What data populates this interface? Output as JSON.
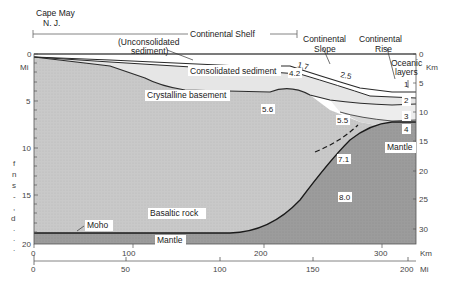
{
  "header": {
    "location_line1": "Cape May",
    "location_line2": "N. J.",
    "shelf_label": "Continental Shelf",
    "slope_line1": "Continental",
    "slope_line2": "Slope",
    "rise_line1": "Continental",
    "rise_line2": "Rise"
  },
  "layers": {
    "unconsolidated_line1": "(Unconsolidated",
    "unconsolidated_line2": "sediment)",
    "consolidated": "Consolidated sediment",
    "crystalline": "Crystalline basement",
    "basaltic": "Basaltic rock",
    "moho": "Moho",
    "mantle_left": "Mantle",
    "mantle_right": "Mantle",
    "oceanic_line1": "Oceanic",
    "oceanic_line2": "layers",
    "oceanic_1": "1",
    "oceanic_2": "2",
    "oceanic_3": "3",
    "oceanic_4": "4"
  },
  "velocities": {
    "v17": "1.7",
    "v25": "2.5",
    "v42": "4.2",
    "v56": "5.6",
    "v55": "5.5",
    "v71": "7.1",
    "v80": "8.0"
  },
  "axes": {
    "left_unit": "Mi",
    "left_ticks": [
      "0",
      "5",
      "10",
      "15",
      "20"
    ],
    "right_unit": "Km",
    "right_ticks": [
      "0",
      "5",
      "10",
      "15",
      "20",
      "25",
      "30"
    ],
    "bottom_km_unit": "Km",
    "bottom_km_ticks": [
      "0",
      "100",
      "200",
      "300"
    ],
    "bottom_mi_unit": "Mi",
    "bottom_mi_ticks": [
      "0",
      "50",
      "100",
      "150",
      "200"
    ]
  },
  "side_text_fragments": [
    "f",
    "n",
    "s",
    "-",
    ",",
    "d",
    ".",
    ".",
    "."
  ],
  "colors": {
    "unconsolidated": "#ffffff",
    "consolidated": "#e6e6e6",
    "crust": "#c8c8c8",
    "oceanic2": "#e4e4e4",
    "oceanic3": "#d0d0d0",
    "mantle": "#9a9a9a",
    "lines": "#2a2a2a"
  }
}
